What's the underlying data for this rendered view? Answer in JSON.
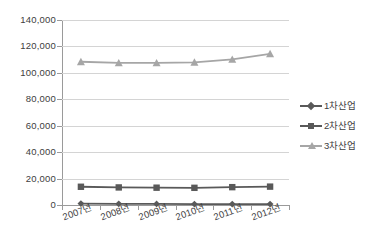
{
  "chart_data": {
    "type": "line",
    "title": "",
    "xlabel": "",
    "ylabel": "",
    "categories": [
      "2007년",
      "2008년",
      "2009년",
      "2010년",
      "2011년",
      "2012년"
    ],
    "series": [
      {
        "name": "1차산업",
        "marker": "diamond",
        "color": "#595959",
        "values": [
          1100,
          900,
          800,
          700,
          700,
          700
        ]
      },
      {
        "name": "2차산업",
        "marker": "square",
        "color": "#595959",
        "values": [
          13800,
          13300,
          13100,
          13000,
          13500,
          13900
        ]
      },
      {
        "name": "3차산업",
        "marker": "triangle",
        "color": "#a6a6a6",
        "values": [
          108400,
          107500,
          107500,
          108000,
          110200,
          114400
        ]
      }
    ],
    "ylim": [
      0,
      140000
    ],
    "ytick_step": 20000,
    "yticks": [
      "0",
      "20,000",
      "40,000",
      "60,000",
      "80,000",
      "100,000",
      "120,000",
      "140,000"
    ],
    "grid": "horizontal",
    "legend_position": "right"
  },
  "legend": {
    "items": [
      {
        "label": "1차산업"
      },
      {
        "label": "2차산업"
      },
      {
        "label": "3차산업"
      }
    ]
  }
}
